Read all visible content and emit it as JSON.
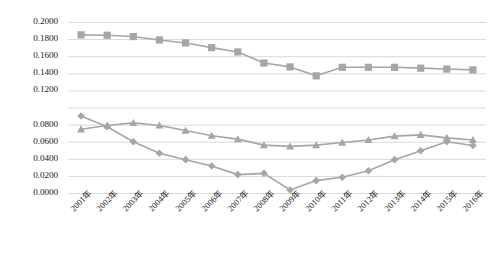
{
  "chart_data": {
    "type": "line",
    "title": "",
    "subtitle": "",
    "xlabel": "",
    "ylabel": "",
    "grid": "horizontal",
    "legend": "none",
    "ylim": [
      0.0,
      0.2
    ],
    "ytick_interval": 0.02,
    "ytick_labels": [
      "0.2000",
      "0.1800",
      "0.1600",
      "0.1400",
      "0.1200",
      "",
      "0.0800",
      "0.0600",
      "0.0400",
      "0.0200",
      "0.0000"
    ],
    "ytick_values": [
      0.2,
      0.18,
      0.16,
      0.14,
      0.12,
      0.1,
      0.08,
      0.06,
      0.04,
      0.02,
      0.0
    ],
    "ytick_note": "the 0.1000 tick label is not rendered in the source image",
    "categories": [
      "2001年",
      "2002年",
      "2003年",
      "2004年",
      "2005年",
      "2006年",
      "2007年",
      "2008年",
      "2009年",
      "2010年",
      "2011年",
      "2012年",
      "2013年",
      "2014年",
      "2015年",
      "2016年"
    ],
    "series": [
      {
        "name": "series-square",
        "marker": "square",
        "color": "#a6a6a6",
        "values": [
          0.185,
          0.1845,
          0.183,
          0.179,
          0.1755,
          0.17,
          0.165,
          0.152,
          0.1475,
          0.137,
          0.147,
          0.147,
          0.147,
          0.146,
          0.145,
          0.144
        ]
      },
      {
        "name": "series-triangle",
        "marker": "triangle",
        "color": "#a6a6a6",
        "values": [
          0.0745,
          0.079,
          0.082,
          0.079,
          0.073,
          0.067,
          0.063,
          0.056,
          0.0545,
          0.056,
          0.059,
          0.062,
          0.0665,
          0.068,
          0.0645,
          0.062
        ]
      },
      {
        "name": "series-diamond",
        "marker": "diamond",
        "color": "#a6a6a6",
        "values": [
          0.09,
          0.0775,
          0.06,
          0.0465,
          0.039,
          0.0315,
          0.0215,
          0.023,
          0.0035,
          0.0145,
          0.0185,
          0.026,
          0.039,
          0.0495,
          0.06,
          0.0555
        ]
      }
    ]
  },
  "style": {
    "grid_color": "#d9d9d9",
    "marker_color": "#a6a6a6",
    "line_color": "#a6a6a6",
    "text_color": "#1a1a1a",
    "background": "#ffffff"
  }
}
